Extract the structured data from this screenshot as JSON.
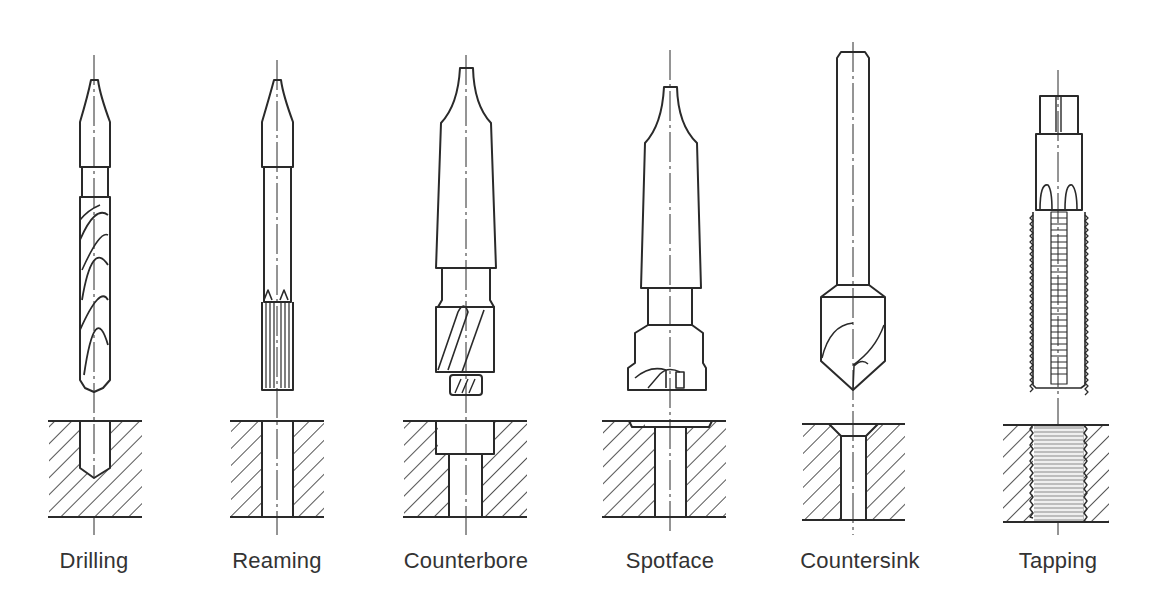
{
  "diagram": {
    "line_color": "#2a2a2a",
    "label_color": "#333333",
    "operations": [
      {
        "id": "drilling",
        "label": "Drilling",
        "center_x": 94
      },
      {
        "id": "reaming",
        "label": "Reaming",
        "center_x": 277
      },
      {
        "id": "counterbore",
        "label": "Counterbore",
        "center_x": 466
      },
      {
        "id": "spotface",
        "label": "Spotface",
        "center_x": 670
      },
      {
        "id": "countersink",
        "label": "Countersink",
        "center_x": 853
      },
      {
        "id": "tapping",
        "label": "Tapping",
        "center_x": 1058
      }
    ]
  }
}
